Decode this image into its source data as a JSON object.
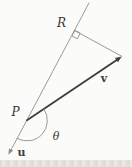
{
  "figure": {
    "labels": {
      "point_r": "R",
      "point_p": "P",
      "vector_v": "v",
      "vector_u": "u",
      "angle_theta": "θ"
    },
    "colors": {
      "background": "#fbfbf9",
      "line": "#8f8f8f",
      "vector": "#3f3f3f",
      "text": "#383838",
      "paper_edge": "#dcdcd8"
    }
  }
}
